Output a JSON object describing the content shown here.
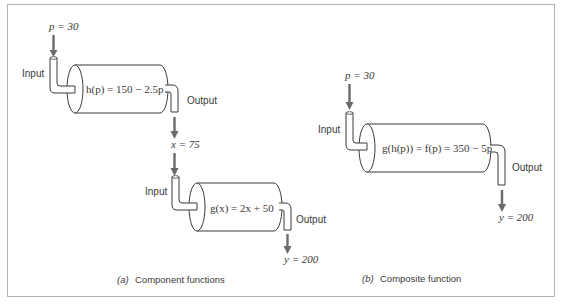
{
  "figure": {
    "panel_a": {
      "caption_letter": "(a)",
      "caption_text": "Component functions",
      "machine_h": {
        "input_label": "Input",
        "output_label": "Output",
        "input_value": "p = 30",
        "formula": "h(p) = 150 − 2.5p",
        "output_value": "x = 75"
      },
      "machine_g": {
        "input_label": "Input",
        "output_label": "Output",
        "formula": "g(x) = 2x + 50",
        "output_value": "y = 200"
      }
    },
    "panel_b": {
      "caption_letter": "(b)",
      "caption_text": "Composite function",
      "machine_f": {
        "input_label": "Input",
        "output_label": "Output",
        "input_value": "p = 30",
        "formula": "g(h(p)) = f(p) = 350 − 5p",
        "output_value": "y = 200"
      }
    },
    "colors": {
      "stroke": "#3a3a3a",
      "arrow": "#6a6a6a",
      "frame": "#b3b3b3"
    }
  }
}
